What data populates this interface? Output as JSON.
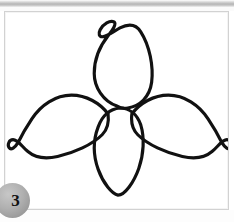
{
  "page": {
    "width": 234,
    "height": 222,
    "background_color": "#ffffff",
    "kind": "scanned-figure-page"
  },
  "scan_band": {
    "name": "scanner-gradient-band",
    "colors": [
      "#ffffff",
      "#d8d8d8",
      "#b4b4b4",
      "#cfcfcf",
      "#f2f2f2"
    ]
  },
  "figure_panel": {
    "border_color": "#d2d2d2",
    "background_color": "#ffffff",
    "inner_edge_color": "#f4f4f4"
  },
  "figure_badge": {
    "label": "3",
    "shape": "circle",
    "fill_color": "#b0b0b0",
    "text_color": "#111111"
  },
  "illustration": {
    "title": "three-petal flower outline",
    "description": "Hand-drawn line art of a trillium-like flower with three curved petals radiating from a central point, plus a central teardrop petal; outlines only, no fill.",
    "stroke_color": "#111111",
    "fill_color": "none",
    "stroke_width": 3.2,
    "parts": [
      {
        "name": "top-petal",
        "shape": "elongated teardrop with curled hook at apex"
      },
      {
        "name": "left-petal",
        "shape": "wing sweeping left with curled tip"
      },
      {
        "name": "right-petal",
        "shape": "wing sweeping right with curled tip"
      },
      {
        "name": "center-petal",
        "shape": "vertical teardrop pointing down"
      }
    ]
  }
}
